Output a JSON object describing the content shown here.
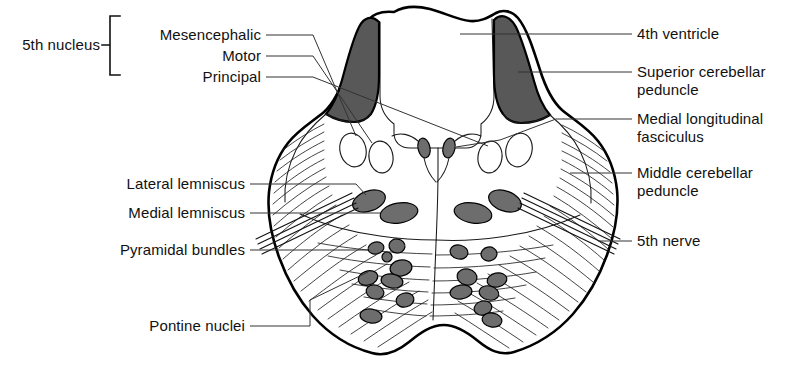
{
  "figure": {
    "background_color": "#ffffff",
    "ink_color": "#111111",
    "shading_color": "#585858",
    "nucleus_fill_color": "#6d6d6d"
  },
  "group_labels": {
    "fifth_nucleus": {
      "label": "5th nucleus",
      "members": [
        {
          "label": "Mesencephalic"
        },
        {
          "label": "Motor"
        },
        {
          "label": "Principal"
        }
      ]
    }
  },
  "left_labels": [
    {
      "label": "Lateral lemniscus"
    },
    {
      "label": "Medial lemniscus"
    },
    {
      "label": "Pyramidal bundles"
    },
    {
      "label": "Pontine nuclei"
    }
  ],
  "right_labels": [
    {
      "label": "4th ventricle"
    },
    {
      "label": "Superior cerebellar",
      "label_line2": "peduncle"
    },
    {
      "label": "Medial longitudinal",
      "label_line2": "fasciculus"
    },
    {
      "label": "Middle cerebellar",
      "label_line2": "peduncle"
    },
    {
      "label": "5th nerve"
    }
  ]
}
